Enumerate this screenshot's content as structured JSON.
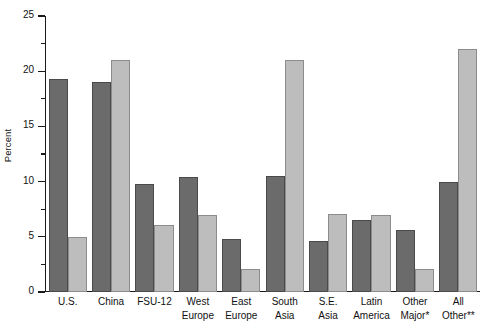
{
  "chart_data": {
    "type": "bar",
    "title": "",
    "xlabel": "",
    "ylabel": "Percent",
    "ylim": [
      0,
      25
    ],
    "ytick_step": 5,
    "yticks": [
      0,
      5,
      10,
      15,
      20,
      25
    ],
    "ytick_labels": [
      "0",
      "5",
      "10",
      "15",
      "20",
      "25"
    ],
    "minor_tick_step": 2.5,
    "grid": false,
    "legend": "none",
    "categories": [
      "U.S.",
      "China",
      "FSU-12",
      "West Europe",
      "East Europe",
      "South Asia",
      "S.E. Asia",
      "Latin America",
      "Other Major*",
      "All Other**"
    ],
    "category_lines": [
      [
        "U.S.",
        ""
      ],
      [
        "China",
        ""
      ],
      [
        "FSU-12",
        ""
      ],
      [
        "West",
        "Europe"
      ],
      [
        "East",
        "Europe"
      ],
      [
        "South",
        "Asia"
      ],
      [
        "S.E.",
        "Asia"
      ],
      [
        "Latin",
        "America"
      ],
      [
        "Other",
        "Major*"
      ],
      [
        "All",
        "Other**"
      ]
    ],
    "series": [
      {
        "name": "series-dark",
        "color": "#6b6b6b",
        "values": [
          19.3,
          19.0,
          9.8,
          10.4,
          4.8,
          10.5,
          4.6,
          6.5,
          5.6,
          10.0
        ]
      },
      {
        "name": "series-light",
        "color": "#bdbdbd",
        "values": [
          5.0,
          21.0,
          6.1,
          7.0,
          2.1,
          21.0,
          7.1,
          7.0,
          2.1,
          22.0
        ]
      }
    ]
  },
  "axis": {
    "y_title": "Percent"
  },
  "colors": {
    "dark_bar": "#6b6b6b",
    "light_bar": "#bdbdbd",
    "dark_bar_edge": "#4a4a4a",
    "light_bar_edge": "#8c8c8c",
    "axis": "#1a1a1a",
    "background": "#ffffff",
    "text": "#111111"
  }
}
